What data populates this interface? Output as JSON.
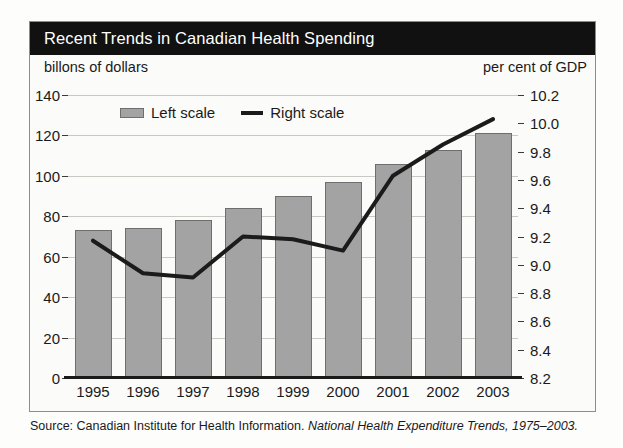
{
  "figure": {
    "title": "Recent Trends in Canadian Health Spending",
    "left_axis_caption": "billons of dollars",
    "right_axis_caption": "per cent of GDP",
    "source_prefix": "Source: Canadian Institute for Health Information.",
    "source_italic": "National Health Expenditure Trends, 1975–2003."
  },
  "legend": {
    "position": "top-center-inside",
    "items": [
      {
        "label": "Left scale",
        "marker": "bar-swatch",
        "color": "#a3a3a3"
      },
      {
        "label": "Right scale",
        "marker": "line-swatch",
        "color": "#1b1b1b"
      }
    ]
  },
  "colors": {
    "banner_background": "#111111",
    "banner_text": "#ffffff",
    "bar_fill": "#a3a3a3",
    "bar_stroke": "#6e6e6e",
    "line": "#1b1b1b",
    "gridline": "#c9c9c4",
    "frame": "#8d8d8d",
    "page_background": "#fdfdfb"
  },
  "chart_data": {
    "type": "bar",
    "title": "Recent Trends in Canadian Health Spending",
    "xlabel": "",
    "ylabel": "billons of dollars",
    "y2label": "per cent of GDP",
    "categories": [
      "1995",
      "1996",
      "1997",
      "1998",
      "1999",
      "2000",
      "2001",
      "2002",
      "2003"
    ],
    "grid": true,
    "ylim": [
      0,
      140
    ],
    "yticks": [
      0,
      20,
      40,
      60,
      80,
      100,
      120,
      140
    ],
    "ytick_labels": [
      "0",
      "20",
      "40",
      "60",
      "80",
      "100",
      "120",
      "140"
    ],
    "y2lim": [
      8.2,
      10.2
    ],
    "y2ticks": [
      8.2,
      8.4,
      8.6,
      8.8,
      9.0,
      9.2,
      9.4,
      9.6,
      9.8,
      10.0,
      10.2
    ],
    "y2tick_labels": [
      "8.2",
      "8.4",
      "8.6",
      "8.8",
      "9.0",
      "9.2",
      "9.4",
      "9.6",
      "9.8",
      "10.0",
      "10.2"
    ],
    "series": [
      {
        "name": "Left scale",
        "type": "bar",
        "axis": "left",
        "unit": "billions of dollars",
        "values": [
          73,
          74,
          78,
          84,
          90,
          97,
          106,
          113,
          121
        ]
      },
      {
        "name": "Right scale",
        "type": "line",
        "axis": "right",
        "unit": "per cent of GDP",
        "values": [
          9.17,
          8.94,
          8.91,
          9.2,
          9.18,
          9.1,
          9.63,
          9.85,
          10.03
        ]
      }
    ]
  }
}
